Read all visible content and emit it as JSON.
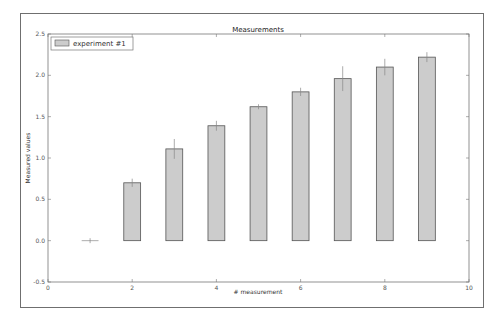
{
  "chart_data": {
    "type": "bar",
    "title": "Measurements",
    "xlabel": "# measurement",
    "ylabel": "Measured values",
    "xlim": [
      0,
      10
    ],
    "ylim": [
      -0.5,
      2.5
    ],
    "x_ticks": [
      "0",
      "2",
      "4",
      "6",
      "8",
      "10"
    ],
    "y_ticks": [
      "-0.5",
      "0.0",
      "0.5",
      "1.0",
      "1.5",
      "2.0",
      "2.5"
    ],
    "grid": false,
    "legend_position": "upper left",
    "series": [
      {
        "name": "experiment #1",
        "x": [
          1,
          2,
          3,
          4,
          5,
          6,
          7,
          8,
          9
        ],
        "values": [
          0.0,
          0.7,
          1.11,
          1.39,
          1.62,
          1.8,
          1.96,
          2.1,
          2.22
        ],
        "errors": [
          0.03,
          0.05,
          0.12,
          0.06,
          0.03,
          0.05,
          0.15,
          0.1,
          0.06
        ],
        "color": "#cccccc",
        "edge_color": "#555555",
        "bar_width": 0.4
      }
    ]
  }
}
